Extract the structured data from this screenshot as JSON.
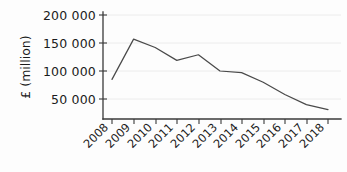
{
  "chart_data": {
    "type": "line",
    "title": "",
    "subtitle": "",
    "xlabel": "",
    "ylabel": "£ (million)",
    "categories": [
      "2008",
      "2009",
      "2010",
      "2011",
      "2012",
      "2013",
      "2014",
      "2015",
      "2016",
      "2017",
      "2018"
    ],
    "x": [
      2008,
      2009,
      2010,
      2011,
      2012,
      2013,
      2014,
      2015,
      2016,
      2017,
      2018
    ],
    "values": [
      85000,
      157000,
      142000,
      119000,
      129000,
      100000,
      97000,
      80000,
      58000,
      40000,
      31000
    ],
    "series": [
      {
        "name": "£ (million)",
        "values": [
          85000,
          157000,
          142000,
          119000,
          129000,
          100000,
          97000,
          80000,
          58000,
          40000,
          31000
        ],
        "color": "#4a4a4a"
      }
    ],
    "ylim": [
      0,
      200000
    ],
    "xlim": [
      2008,
      2018
    ],
    "yticks": [
      50000,
      100000,
      150000,
      200000
    ],
    "ytick_labels": [
      "50 000",
      "100 000",
      "150 000",
      "200 000"
    ],
    "xtick_labels": [
      "2008",
      "2009",
      "2010",
      "2011",
      "2012",
      "2013",
      "2014",
      "2015",
      "2016",
      "2017",
      "2018"
    ],
    "grid": true,
    "grid_axis": "y",
    "legend": false,
    "legend_position": "none",
    "xtick_rotation": -45,
    "ylabel_rotation": -90,
    "colors": {
      "line": "#4a4a4a",
      "axis": "#3a3a3a",
      "grid": "#ececec",
      "text": "#1b1b1b",
      "background": "#fdfdfd"
    }
  },
  "axes": {
    "y_title": "£ (million)",
    "y_tick_labels": [
      "200 000",
      "150 000",
      "100 000",
      "50 000"
    ],
    "x_tick_labels": [
      "2008",
      "2009",
      "2010",
      "2011",
      "2012",
      "2013",
      "2014",
      "2015",
      "2016",
      "2017",
      "2018"
    ]
  }
}
